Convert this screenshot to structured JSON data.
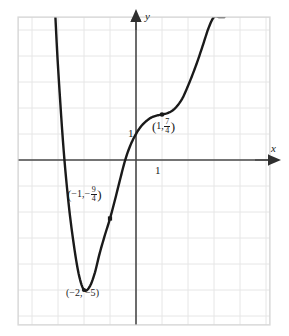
{
  "chart_data": {
    "type": "line",
    "title": "",
    "xlabel": "x",
    "ylabel": "y",
    "grid": true,
    "legend_position": "none",
    "xlim": [
      -4.55,
      5.15
    ],
    "ylim": [
      -7.5,
      5.5
    ],
    "x_tick_labels": [
      "1"
    ],
    "y_tick_labels": [
      "1"
    ],
    "x_ticks": [
      1
    ],
    "y_ticks": [
      1
    ],
    "grid_spacing_units": 1,
    "annotations": [
      {
        "id": "local-min",
        "x": -2,
        "y": -5,
        "label_text": "(-2, -5)",
        "marked_point": true
      },
      {
        "id": "point-neg-one",
        "x": -1,
        "y": -2.25,
        "label_text": "(-1, -9/4)",
        "marked_point": true
      },
      {
        "id": "inflection-point",
        "x": 1,
        "y": 1.75,
        "label_text": "(1, 7/4)",
        "marked_point": true
      }
    ],
    "series": [
      {
        "name": "curve",
        "description": "Polynomial curve with local minimum at (-2,-5), passing through (-1,-9/4), crossing x-axis near x=-0.55, y-intercept near 1, flat inflection at (1,7/4), then rising steeply",
        "x": [
          -3.1,
          -3.0,
          -2.8,
          -2.6,
          -2.4,
          -2.2,
          -2.0,
          -1.8,
          -1.6,
          -1.4,
          -1.2,
          -1.0,
          -0.8,
          -0.6,
          -0.4,
          -0.2,
          0.0,
          0.2,
          0.4,
          0.6,
          0.8,
          1.0,
          1.2,
          1.4,
          1.6,
          1.8,
          2.0,
          2.2,
          2.4,
          2.6,
          2.8,
          3.0,
          3.2,
          3.4
        ],
        "y": [
          5.5,
          3.6,
          0.6,
          -1.6,
          -3.2,
          -4.4,
          -5.0,
          -4.9,
          -4.4,
          -3.6,
          -2.9,
          -2.25,
          -1.5,
          -0.7,
          0.05,
          0.6,
          1.0,
          1.3,
          1.5,
          1.64,
          1.71,
          1.75,
          1.8,
          1.9,
          2.1,
          2.4,
          2.85,
          3.35,
          3.9,
          4.5,
          5.1,
          5.5,
          5.5,
          5.5
        ]
      }
    ]
  },
  "axes": {
    "x_axis_label": "x",
    "y_axis_label": "y",
    "x_tick_one": "1",
    "y_tick_one": "1"
  },
  "labels": {
    "min_point": {
      "open": "(",
      "x_value": "−2,",
      "y_value": "−5",
      "close": ")"
    },
    "neg_one_point": {
      "open": "(",
      "x_value": "−1,",
      "neg_sign": "−",
      "num": "9",
      "den": "4",
      "close": ")"
    },
    "inflection_point": {
      "open": "(",
      "x_value": "1,",
      "num": "7",
      "den": "4",
      "close": ")"
    }
  },
  "colors": {
    "curve": "#1a1a1a",
    "axis": "#444444",
    "grid": "#e3e3e3",
    "border": "#d4d4d4",
    "background": "#ffffff",
    "text": "#1a1a1a"
  }
}
